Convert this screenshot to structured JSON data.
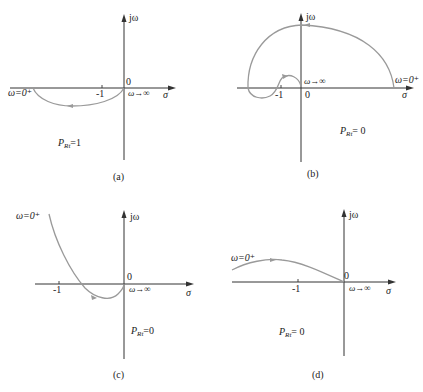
{
  "figure": {
    "panels": [
      {
        "id": "a",
        "caption": "(a)",
        "y_axis_label": "jω",
        "x_axis_label": "σ",
        "origin_label": "0",
        "tick_label": "-1",
        "start_label": "ω=0⁺",
        "end_label": "ω→∞",
        "p_label_main": "P",
        "p_label_sub": "Rt",
        "p_label_value": "=1"
      },
      {
        "id": "b",
        "caption": "(b)",
        "y_axis_label": "jω",
        "x_axis_label": "σ",
        "origin_label": "0",
        "tick_label": "-1",
        "start_label": "ω=0⁺",
        "end_label": "ω→∞",
        "p_label_main": "P",
        "p_label_sub": "Rt",
        "p_label_value": "= 0"
      },
      {
        "id": "c",
        "caption": "(c)",
        "y_axis_label": "jω",
        "x_axis_label": "σ",
        "origin_label": "0",
        "tick_label": "-1",
        "start_label": "ω=0⁺",
        "end_label": "ω→∞",
        "p_label_main": "P",
        "p_label_sub": "Rt",
        "p_label_value": "=0"
      },
      {
        "id": "d",
        "caption": "(d)",
        "y_axis_label": "jω",
        "x_axis_label": "σ",
        "origin_label": "0",
        "tick_label": "-1",
        "start_label": "ω=0⁺",
        "end_label": "ω→∞",
        "p_label_main": "P",
        "p_label_sub": "Rt",
        "p_label_value": "= 0"
      }
    ],
    "colors": {
      "axis": "#333333",
      "curve": "#9a9a9a",
      "background": "#ffffff"
    }
  }
}
